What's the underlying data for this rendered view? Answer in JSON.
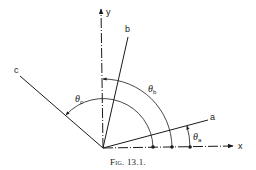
{
  "figure": {
    "caption": "Fig. 13.1.",
    "axes": {
      "x_label": "x",
      "y_label": "y"
    },
    "lines": [
      {
        "id": "a",
        "label": "a"
      },
      {
        "id": "b",
        "label": "b"
      },
      {
        "id": "c",
        "label": "c"
      }
    ],
    "angles": [
      {
        "id": "theta_a",
        "symbol": "θ",
        "subscript": "a"
      },
      {
        "id": "theta_b",
        "symbol": "θ",
        "subscript": "b"
      },
      {
        "id": "theta_c",
        "symbol": "θ",
        "subscript": "c"
      }
    ],
    "colors": {
      "ink": "#1a1a1a",
      "background": "#ffffff"
    }
  }
}
